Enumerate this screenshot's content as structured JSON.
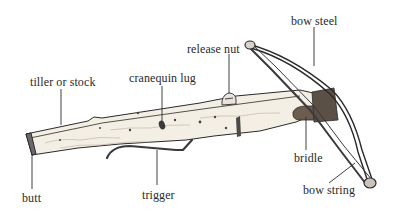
{
  "diagram": {
    "labels": [
      {
        "id": "tiller",
        "text": "tiller or stock",
        "x": 30,
        "y": 76
      },
      {
        "id": "cranequin",
        "text": "cranequin lug",
        "x": 129,
        "y": 72
      },
      {
        "id": "release",
        "text": "release nut",
        "x": 187,
        "y": 43
      },
      {
        "id": "bowsteel",
        "text": "bow steel",
        "x": 291,
        "y": 15
      },
      {
        "id": "butt",
        "text": "butt",
        "x": 22,
        "y": 192
      },
      {
        "id": "trigger",
        "text": "trigger",
        "x": 142,
        "y": 189
      },
      {
        "id": "bridle",
        "text": "bridle",
        "x": 294,
        "y": 152
      },
      {
        "id": "bowstring",
        "text": "bow string",
        "x": 303,
        "y": 184
      }
    ],
    "colors": {
      "ink": "#2a2a2a",
      "wood": "#f3ede2",
      "metal": "#7a7a7a",
      "background": "#ffffff"
    }
  }
}
